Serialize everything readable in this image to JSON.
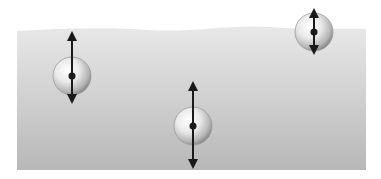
{
  "diagram": {
    "type": "buoyancy-illustration",
    "background_color": "#ffffff",
    "fluid": {
      "label": "liquid",
      "color_top": "#e6e6e6",
      "color_bottom": "#b9b9b9",
      "left": 17,
      "right": 366,
      "surface_y": 30,
      "bottom_y": 170
    },
    "balls": [
      {
        "id": "ball-floating-left",
        "state": "submerged-near-surface",
        "cx": 72,
        "cy": 76,
        "r": 19,
        "arrow_up_length": 40,
        "arrow_down_length": 23
      },
      {
        "id": "ball-submerged-middle",
        "state": "submerged",
        "cx": 193,
        "cy": 126,
        "r": 19,
        "arrow_up_length": 40,
        "arrow_down_length": 38
      },
      {
        "id": "ball-above-surface-right",
        "state": "floating-on-surface",
        "cx": 314,
        "cy": 32,
        "r": 19,
        "arrow_up_length": 19,
        "arrow_down_length": 18
      }
    ],
    "arrow_color": "#1a1a1a",
    "ball_highlight": "#ffffff",
    "ball_shadow": "#8a8a8a"
  }
}
